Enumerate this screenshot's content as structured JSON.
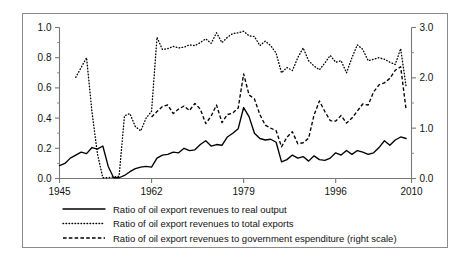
{
  "chart_data": {
    "type": "line",
    "title": "",
    "subtitle": "",
    "xlabel": "",
    "ylabel": "",
    "y2label": "",
    "grid": false,
    "legend_position": "bottom",
    "xlim": [
      1945,
      2010
    ],
    "ylim": [
      0.0,
      1.0
    ],
    "y2lim": [
      0.0,
      3.0
    ],
    "xticks": [
      1945,
      1962,
      1979,
      1996,
      2010
    ],
    "xtick_labels": [
      "1945",
      "1962",
      "1979",
      "1996",
      "2010"
    ],
    "yticks": [
      0.0,
      0.2,
      0.4,
      0.6,
      0.8,
      1.0
    ],
    "ytick_labels": [
      "0.0",
      "0.2",
      "0.4",
      "0.6",
      "0.8",
      "1.0"
    ],
    "y_minor_ticks": [
      0.1,
      0.3,
      0.5,
      0.7,
      0.9
    ],
    "y2ticks": [
      0.0,
      1.0,
      2.0,
      3.0
    ],
    "y2tick_labels": [
      "0.0",
      "1.0",
      "2.0",
      "3.0"
    ],
    "y2_minor_ticks": [
      0.5,
      1.5,
      2.5
    ],
    "x": [
      1945,
      1946,
      1947,
      1948,
      1949,
      1950,
      1951,
      1952,
      1953,
      1954,
      1955,
      1956,
      1957,
      1958,
      1959,
      1960,
      1961,
      1962,
      1963,
      1964,
      1965,
      1966,
      1967,
      1968,
      1969,
      1970,
      1971,
      1972,
      1973,
      1974,
      1975,
      1976,
      1977,
      1978,
      1979,
      1980,
      1981,
      1982,
      1983,
      1984,
      1985,
      1986,
      1987,
      1988,
      1989,
      1990,
      1991,
      1992,
      1993,
      1994,
      1995,
      1996,
      1997,
      1998,
      1999,
      2000,
      2001,
      2002,
      2003,
      2004,
      2005,
      2006,
      2007,
      2008,
      2009
    ],
    "series": [
      {
        "name": "Ratio of oil export revenues to real output",
        "style": "solid",
        "axis": "left",
        "values": [
          0.085,
          0.1,
          0.135,
          0.155,
          0.175,
          0.165,
          0.205,
          0.195,
          0.215,
          0.08,
          0.005,
          0.005,
          0.02,
          0.045,
          0.065,
          0.075,
          0.08,
          0.075,
          0.135,
          0.155,
          0.16,
          0.175,
          0.17,
          0.2,
          0.185,
          0.19,
          0.225,
          0.25,
          0.215,
          0.225,
          0.22,
          0.275,
          0.3,
          0.33,
          0.47,
          0.41,
          0.3,
          0.265,
          0.255,
          0.26,
          0.24,
          0.11,
          0.125,
          0.155,
          0.135,
          0.145,
          0.115,
          0.15,
          0.125,
          0.12,
          0.135,
          0.17,
          0.155,
          0.185,
          0.16,
          0.185,
          0.175,
          0.16,
          0.17,
          0.205,
          0.25,
          0.22,
          0.255,
          0.275,
          0.265
        ]
      },
      {
        "name": "Ratio of oil export revenues to total exports",
        "style": "dotted",
        "axis": "left",
        "values": [
          null,
          null,
          null,
          0.67,
          0.735,
          0.8,
          0.44,
          0.165,
          0.005,
          0.005,
          0.01,
          0.015,
          0.415,
          0.43,
          0.345,
          0.315,
          0.4,
          0.445,
          0.935,
          0.855,
          0.86,
          0.875,
          0.865,
          0.87,
          0.885,
          0.88,
          0.9,
          0.925,
          0.895,
          0.965,
          0.9,
          0.935,
          0.96,
          0.965,
          0.975,
          0.945,
          0.94,
          0.88,
          0.91,
          0.88,
          0.83,
          0.7,
          0.735,
          0.715,
          0.8,
          0.865,
          0.78,
          0.745,
          0.72,
          0.765,
          0.815,
          0.77,
          0.78,
          0.7,
          0.8,
          0.885,
          0.855,
          0.78,
          0.79,
          0.8,
          0.79,
          0.77,
          0.755,
          0.86,
          0.61
        ]
      },
      {
        "name": "Ratio of oil export revenues to government espenditure (right scale)",
        "style": "dashed",
        "axis": "right",
        "values": [
          null,
          null,
          null,
          null,
          null,
          null,
          null,
          null,
          null,
          null,
          null,
          null,
          null,
          null,
          null,
          null,
          null,
          1.22,
          1.33,
          1.43,
          1.46,
          1.29,
          1.38,
          1.44,
          1.35,
          1.49,
          1.38,
          1.09,
          1.24,
          1.46,
          1.11,
          1.27,
          1.3,
          1.4,
          2.08,
          1.66,
          1.58,
          1.27,
          1.06,
          1.0,
          0.95,
          0.63,
          0.82,
          0.93,
          0.69,
          0.71,
          0.8,
          1.26,
          1.54,
          1.33,
          1.15,
          1.14,
          1.25,
          1.1,
          1.2,
          1.34,
          1.48,
          1.46,
          1.72,
          1.86,
          1.9,
          1.99,
          2.15,
          2.22,
          1.37
        ]
      }
    ],
    "legend": [
      {
        "label": "Ratio of oil export revenues to real output",
        "style": "solid"
      },
      {
        "label": "Ratio of oil export revenues to total exports",
        "style": "dotted"
      },
      {
        "label": "Ratio of oil export revenues to government espenditure (right scale)",
        "style": "dashed"
      }
    ],
    "colors": {
      "series": "#000000",
      "axis": "#777777",
      "frame": "#8a8a8a",
      "background": "#ffffff"
    }
  }
}
